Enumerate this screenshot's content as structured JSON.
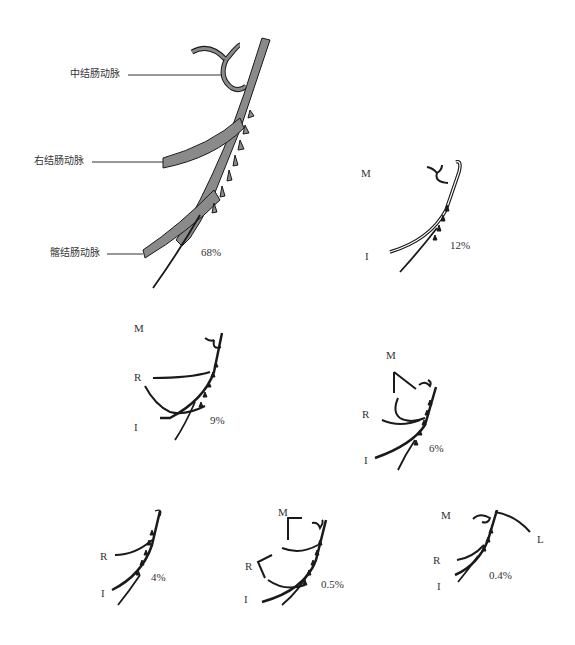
{
  "figure": {
    "main_variant": {
      "labels": {
        "middle_colic": "中结肠动脉",
        "right_colic": "右结肠动脉",
        "ileocolic": "髂结肠动脉"
      },
      "percent": "68%"
    },
    "variants": [
      {
        "id": "v2",
        "labels": [
          "M",
          "I"
        ],
        "percent": "12%"
      },
      {
        "id": "v3",
        "labels": [
          "M",
          "R",
          "I"
        ],
        "percent": "9%"
      },
      {
        "id": "v4",
        "labels": [
          "M",
          "R",
          "I"
        ],
        "percent": "6%"
      },
      {
        "id": "v5",
        "labels": [
          "R",
          "I"
        ],
        "percent": "4%"
      },
      {
        "id": "v6",
        "labels": [
          "M",
          "R",
          "I"
        ],
        "percent": "0.5%"
      },
      {
        "id": "v7",
        "labels": [
          "M",
          "L",
          "R",
          "I"
        ],
        "percent": "0.4%"
      }
    ],
    "colors": {
      "artery_fill": "#8a8a8a",
      "stroke": "#1a1a1a",
      "background": "#ffffff"
    }
  }
}
